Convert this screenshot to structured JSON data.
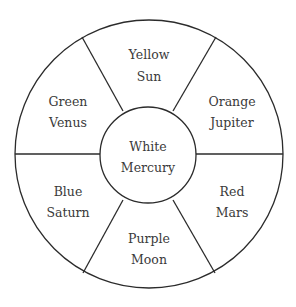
{
  "diagram": {
    "type": "color-wheel",
    "center": {
      "color": "White",
      "body": "Mercury"
    },
    "segments": [
      {
        "position": "top",
        "color": "Yellow",
        "body": "Sun"
      },
      {
        "position": "upper-right",
        "color": "Orange",
        "body": "Jupiter"
      },
      {
        "position": "lower-right",
        "color": "Red",
        "body": "Mars"
      },
      {
        "position": "bottom",
        "color": "Purple",
        "body": "Moon"
      },
      {
        "position": "lower-left",
        "color": "Blue",
        "body": "Saturn"
      },
      {
        "position": "upper-left",
        "color": "Green",
        "body": "Venus"
      }
    ]
  }
}
